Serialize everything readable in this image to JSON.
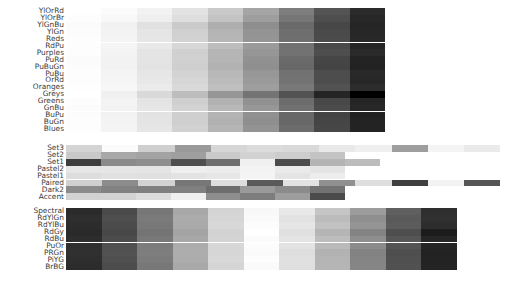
{
  "figure": {
    "background": "#ffffff",
    "label_color": "#3a3a3a",
    "bar_left_px": 66,
    "row_pitch_px": 6.9
  },
  "chart_data": {
    "type": "heatmap",
    "title": "",
    "subtitle": "",
    "xlabel": "",
    "ylabel": "",
    "legend": "none",
    "grid": false,
    "groups": [
      {
        "name": "sequential",
        "top_px": 8,
        "bar_right_px": 385,
        "rows": [
          {
            "label": "YlOrRd",
            "bins": [
              "#ffffff",
              "#fbfbfb",
              "#f2f2f2",
              "#e3e3e3",
              "#c9c9c9",
              "#a5a5a5",
              "#7d7d7d",
              "#545454",
              "#2b2b2b"
            ]
          },
          {
            "label": "YlOrBr",
            "bins": [
              "#fdfdfd",
              "#f8f8f8",
              "#efefef",
              "#dedede",
              "#c3c3c3",
              "#9e9e9e",
              "#767676",
              "#4e4e4e",
              "#272727"
            ]
          },
          {
            "label": "YlGnBu",
            "bins": [
              "#fbfbfb",
              "#f1f1f1",
              "#e1e1e1",
              "#cacaca",
              "#aeaeae",
              "#8e8e8e",
              "#6a6a6a",
              "#474747",
              "#252525"
            ]
          },
          {
            "label": "YlGn",
            "bins": [
              "#fcfcfc",
              "#f3f3f3",
              "#e5e5e5",
              "#d0d0d0",
              "#b4b4b4",
              "#949494",
              "#6e6e6e",
              "#4a4a4a",
              "#272727"
            ]
          },
          {
            "label": "Reds",
            "bins": [
              "#fdfdfd",
              "#f4f4f4",
              "#e6e6e6",
              "#d2d2d2",
              "#b6b6b6",
              "#959595",
              "#6f6f6f",
              "#4b4b4b",
              "#282828"
            ]
          },
          {
            "label": "RdPu",
            "bins": [
              "#fdfdfd",
              "#f5f5f5",
              "#e9e9e9",
              "#d7d7d7",
              "#bdbdbd",
              "#9b9b9b",
              "#727272",
              "#4a4a4a",
              "#242424"
            ]
          },
          {
            "label": "Purples",
            "bins": [
              "#fdfdfd",
              "#f3f3f3",
              "#e4e4e4",
              "#d0d0d0",
              "#b5b5b5",
              "#969696",
              "#727272",
              "#4e4e4e",
              "#2a2a2a"
            ]
          },
          {
            "label": "PuRd",
            "bins": [
              "#fbfbfb",
              "#f2f2f2",
              "#e4e4e4",
              "#d1d1d1",
              "#b5b5b5",
              "#919191",
              "#6a6a6a",
              "#464646",
              "#232323"
            ]
          },
          {
            "label": "PuBuGn",
            "bins": [
              "#fcfcfc",
              "#f2f2f2",
              "#e3e3e3",
              "#cfcfcf",
              "#b2b2b2",
              "#8f8f8f",
              "#686868",
              "#444444",
              "#222222"
            ]
          },
          {
            "label": "PuBu",
            "bins": [
              "#fdfdfd",
              "#f4f4f4",
              "#e6e6e6",
              "#d3d3d3",
              "#b8b8b8",
              "#979797",
              "#727272",
              "#4d4d4d",
              "#292929"
            ]
          },
          {
            "label": "OrRd",
            "bins": [
              "#fdfdfd",
              "#f5f5f5",
              "#e8e8e8",
              "#d6d6d6",
              "#bbbbbb",
              "#9a9a9a",
              "#737373",
              "#4d4d4d",
              "#272727"
            ]
          },
          {
            "label": "Oranges",
            "bins": [
              "#fefefe",
              "#f7f7f7",
              "#ebebeb",
              "#d9d9d9",
              "#bfbfbf",
              "#9e9e9e",
              "#787878",
              "#525252",
              "#2c2c2c"
            ]
          },
          {
            "label": "Greys",
            "bins": [
              "#ffffff",
              "#f0f0f0",
              "#d9d9d9",
              "#bdbdbd",
              "#969696",
              "#737373",
              "#525252",
              "#252525",
              "#000000"
            ]
          },
          {
            "label": "Greens",
            "bins": [
              "#fdfdfd",
              "#f3f3f3",
              "#e4e4e4",
              "#cfcfcf",
              "#b2b2b2",
              "#919191",
              "#6c6c6c",
              "#484848",
              "#252525"
            ]
          },
          {
            "label": "GnBu",
            "bins": [
              "#fcfcfc",
              "#f3f3f3",
              "#e6e6e6",
              "#d3d3d3",
              "#b8b8b8",
              "#979797",
              "#707070",
              "#4b4b4b",
              "#272727"
            ]
          },
          {
            "label": "BuPu",
            "bins": [
              "#fcfcfc",
              "#f2f2f2",
              "#e3e3e3",
              "#cfcfcf",
              "#b3b3b3",
              "#909090",
              "#686868",
              "#434343",
              "#212121"
            ]
          },
          {
            "label": "BuGn",
            "bins": [
              "#fdfdfd",
              "#f3f3f3",
              "#e4e4e4",
              "#cfcfcf",
              "#b1b1b1",
              "#8e8e8e",
              "#686868",
              "#454545",
              "#232323"
            ]
          },
          {
            "label": "Blues",
            "bins": [
              "#fdfdfd",
              "#f4f4f4",
              "#e6e6e6",
              "#d2d2d2",
              "#b5b5b5",
              "#939393",
              "#6c6c6c",
              "#474747",
              "#232323"
            ]
          }
        ]
      },
      {
        "name": "qualitative",
        "top_px": 145,
        "rows": [
          {
            "label": "Set3",
            "bar_right_px": 500,
            "bins": [
              "#d4d4d4",
              "#fbfbfb",
              "#cfcfcf",
              "#9a9a9a",
              "#d6d6d6",
              "#dcdcdc",
              "#d9d9d9",
              "#e9e9e9",
              "#efefef",
              "#9e9e9e",
              "#f4f4f4",
              "#eaeaea"
            ]
          },
          {
            "label": "Set2",
            "bar_right_px": 345,
            "bins": [
              "#c9c9c9",
              "#a8a8a8",
              "#a3a3a3",
              "#9f9f9f",
              "#cacaca",
              "#d2d2d2",
              "#cdcdcd",
              "#c4c4c4"
            ]
          },
          {
            "label": "Set1",
            "bar_right_px": 380,
            "bins": [
              "#3d3d3d",
              "#8a8a8a",
              "#8e8e8e",
              "#4f4f4f",
              "#6e6e6e",
              "#f0f0f0",
              "#4c4c4c",
              "#b4b4b4",
              "#bcbcbc"
            ]
          },
          {
            "label": "Pastel2",
            "bar_right_px": 345,
            "bins": [
              "#e6e6e6",
              "#e6e6e6",
              "#e4e4e4",
              "#efefef",
              "#ececec",
              "#f3f3f3",
              "#eaeaea",
              "#e4e4e4"
            ]
          },
          {
            "label": "Pastel1",
            "bar_right_px": 345,
            "bins": [
              "#dddddd",
              "#e1e1e1",
              "#e0e0e0",
              "#e3e3e3",
              "#e6e6e6",
              "#f4f4f4",
              "#e4e4e4",
              "#ededed"
            ]
          },
          {
            "label": "Paired",
            "bar_right_px": 500,
            "bins": [
              "#d0d0d0",
              "#8c8c8c",
              "#d2d2d2",
              "#777777",
              "#dddddd",
              "#5a5a5a",
              "#e2e2e2",
              "#909090",
              "#dedede",
              "#3f3f3f",
              "#f2f2f2",
              "#555555"
            ]
          },
          {
            "label": "Dark2",
            "bar_right_px": 345,
            "bins": [
              "#8b8b8b",
              "#828282",
              "#7f7f7f",
              "#808080",
              "#6d6d6d",
              "#9a9a9a",
              "#8b8b8b",
              "#727272"
            ]
          },
          {
            "label": "Accent",
            "bar_right_px": 345,
            "bins": [
              "#d2d2d2",
              "#d3d3d3",
              "#dcdcdc",
              "#efefef",
              "#8e8e8e",
              "#7d7d7d",
              "#9d9d9d",
              "#4b4b4b"
            ]
          }
        ]
      },
      {
        "name": "diverging",
        "top_px": 208,
        "bar_right_px": 457,
        "rows": [
          {
            "label": "Spectral",
            "bins": [
              "#2b2b2b",
              "#4a4a4a",
              "#777777",
              "#a8a8a8",
              "#d4d4d4",
              "#f8f8f8",
              "#e8e8e8",
              "#c5c5c5",
              "#9c9c9c",
              "#5f5f5f",
              "#2e2e2e"
            ]
          },
          {
            "label": "RdYlGn",
            "bins": [
              "#2e2e2e",
              "#4e4e4e",
              "#7a7a7a",
              "#ababab",
              "#d6d6d6",
              "#fafafa",
              "#e2e2e2",
              "#bcbcbc",
              "#8f8f8f",
              "#5a5a5a",
              "#303030"
            ]
          },
          {
            "label": "RdYlBu",
            "bins": [
              "#2c2c2c",
              "#4b4b4b",
              "#787878",
              "#aaaaaa",
              "#d8d8d8",
              "#fcfcfc",
              "#e6e6e6",
              "#c2c2c2",
              "#949494",
              "#5c5c5c",
              "#2d2d2d"
            ]
          },
          {
            "label": "RdGy",
            "bins": [
              "#2a2a2a",
              "#484848",
              "#747474",
              "#a4a4a4",
              "#d3d3d3",
              "#ffffff",
              "#e0e0e0",
              "#b5b5b5",
              "#838383",
              "#4e4e4e",
              "#1c1c1c"
            ]
          },
          {
            "label": "RdBu",
            "bins": [
              "#2d2d2d",
              "#4c4c4c",
              "#787878",
              "#a8a8a8",
              "#d4d4d4",
              "#fbfbfb",
              "#e4e4e4",
              "#bdbdbd",
              "#8e8e8e",
              "#565656",
              "#262626"
            ]
          },
          {
            "label": "PuOr",
            "bins": [
              "#2f2f2f",
              "#505050",
              "#7c7c7c",
              "#acacac",
              "#d7d7d7",
              "#fcfcfc",
              "#e3e3e3",
              "#bababa",
              "#8b8b8b",
              "#545454",
              "#242424"
            ]
          },
          {
            "label": "PRGn",
            "bins": [
              "#303030",
              "#525252",
              "#7e7e7e",
              "#adadad",
              "#d6d6d6",
              "#fafafa",
              "#dedede",
              "#b2b2b2",
              "#828282",
              "#4e4e4e",
              "#222222"
            ]
          },
          {
            "label": "PiYG",
            "bins": [
              "#2e2e2e",
              "#4f4f4f",
              "#7b7b7b",
              "#acacac",
              "#d8d8d8",
              "#fdfdfd",
              "#e0e0e0",
              "#b4b4b4",
              "#848484",
              "#505050",
              "#232323"
            ]
          },
          {
            "label": "BrBG",
            "bins": [
              "#2c2c2c",
              "#4c4c4c",
              "#787878",
              "#a9a9a9",
              "#d5d5d5",
              "#fafafa",
              "#dfdfdf",
              "#b5b5b5",
              "#868686",
              "#515151",
              "#242424"
            ]
          }
        ]
      }
    ]
  }
}
